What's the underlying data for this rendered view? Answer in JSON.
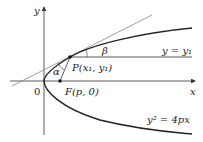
{
  "diagram": {
    "labels": {
      "y_axis": "y",
      "x_axis": "x",
      "origin": "0",
      "point_p": "P(x₁, y₁)",
      "focus": "F(p, 0)",
      "line_label": "y = y₁",
      "parabola_eq": "y² = 4px",
      "alpha": "α",
      "beta": "β"
    },
    "colors": {
      "curve": "#222222",
      "tangent": "#777777",
      "axis": "#333333"
    }
  }
}
